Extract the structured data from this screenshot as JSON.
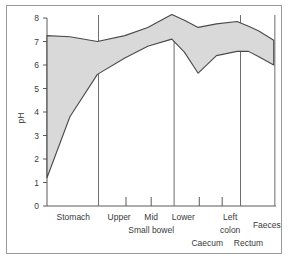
{
  "chart_data": {
    "type": "area",
    "title": "",
    "xlabel": "",
    "ylabel": "pH",
    "ylim": [
      0,
      8
    ],
    "yticks": [
      0,
      1,
      2,
      3,
      4,
      5,
      6,
      7,
      8
    ],
    "ytick_labels": [
      "0",
      "1",
      "2",
      "3",
      "4",
      "5",
      "6",
      "7",
      "8"
    ],
    "grid": false,
    "legend": "none",
    "categories": [
      "Stomach",
      "Upper",
      "Mid",
      "Lower",
      "Caecum",
      "Left colon",
      "Rectum",
      "Faeces"
    ],
    "category_group_labels": [
      {
        "label": "Stomach",
        "x_frac": 0.115
      },
      {
        "label": "Upper",
        "x_frac": 0.315
      },
      {
        "label": "Mid",
        "x_frac": 0.455
      },
      {
        "label": "Lower",
        "x_frac": 0.595
      },
      {
        "label": "Small bowel",
        "x_frac": 0.455
      },
      {
        "label": "Caecum",
        "x_frac": 0.7
      },
      {
        "label": "Left",
        "x_frac": 0.8
      },
      {
        "label": "colon",
        "x_frac": 0.8
      },
      {
        "label": "Rectum",
        "x_frac": 0.88
      },
      {
        "label": "Faeces",
        "x_frac": 0.96
      }
    ],
    "series": [
      {
        "name": "Upper pH limit",
        "x": [
          0.0,
          0.1,
          0.22,
          0.34,
          0.44,
          0.545,
          0.6,
          0.66,
          0.74,
          0.83,
          0.88,
          0.925,
          0.99
        ],
        "values": [
          7.25,
          7.2,
          7.0,
          7.25,
          7.6,
          8.15,
          7.9,
          7.6,
          7.75,
          7.85,
          7.65,
          7.45,
          7.05
        ]
      },
      {
        "name": "Lower pH limit",
        "x": [
          0.0,
          0.1,
          0.22,
          0.34,
          0.44,
          0.545,
          0.6,
          0.66,
          0.74,
          0.83,
          0.88,
          0.925,
          0.99
        ],
        "values": [
          1.2,
          3.8,
          5.6,
          6.3,
          6.8,
          7.1,
          6.55,
          5.65,
          6.4,
          6.58,
          6.58,
          6.35,
          6.0
        ]
      }
    ],
    "band_fill_color": "#d9d9d9",
    "band_stroke_color": "#4a4a4a",
    "separators_x_frac": [
      0.225,
      0.555,
      0.845,
      0.995
    ],
    "minor_ticks_x_frac": [
      0.345,
      0.455,
      0.665,
      0.765
    ]
  },
  "frame": {
    "border_color": "#9a9a9a",
    "background": "#ffffff"
  }
}
